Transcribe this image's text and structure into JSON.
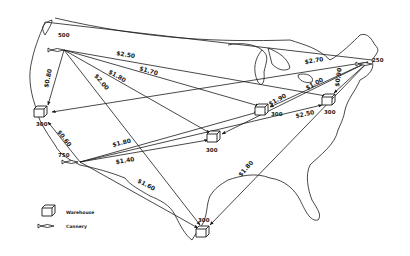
{
  "legend": {
    "warehouse_label": "Warehouse",
    "cannery_label": "Cannery"
  },
  "canneries": [
    {
      "id": "seattle",
      "capacity": "500"
    },
    {
      "id": "california",
      "capacity": "750"
    },
    {
      "id": "northeast",
      "capacity": "250"
    }
  ],
  "warehouses": [
    {
      "id": "west",
      "demand": "300"
    },
    {
      "id": "central",
      "demand": "300"
    },
    {
      "id": "chicago",
      "demand": "300"
    },
    {
      "id": "east",
      "demand": "300"
    },
    {
      "id": "south",
      "demand": "300"
    }
  ],
  "routes": [
    {
      "from": "seattle",
      "to": "east",
      "cost": "$2.50"
    },
    {
      "from": "seattle",
      "to": "chicago",
      "cost": "$1.70"
    },
    {
      "from": "seattle",
      "to": "central",
      "cost": "$1.80"
    },
    {
      "from": "seattle",
      "to": "south",
      "cost": "$2.00"
    },
    {
      "from": "seattle",
      "to": "west",
      "cost": "$0.80"
    },
    {
      "from": "california",
      "to": "west",
      "cost": "$0.60"
    },
    {
      "from": "california",
      "to": "chicago",
      "cost": "$1.80"
    },
    {
      "from": "california",
      "to": "central",
      "cost": "$1.40"
    },
    {
      "from": "california",
      "to": "south",
      "cost": "$1.60"
    },
    {
      "from": "northeast",
      "to": "west",
      "cost": "$2.70"
    },
    {
      "from": "northeast",
      "to": "east",
      "cost": "$0.90"
    },
    {
      "from": "northeast",
      "to": "chicago",
      "cost": "$1.90"
    },
    {
      "from": "northeast",
      "to": "central",
      "cost": "$1.00"
    },
    {
      "from": "california",
      "to": "east",
      "cost": "$2.50"
    },
    {
      "from": "northeast",
      "to": "south",
      "cost": "$1.80"
    }
  ]
}
